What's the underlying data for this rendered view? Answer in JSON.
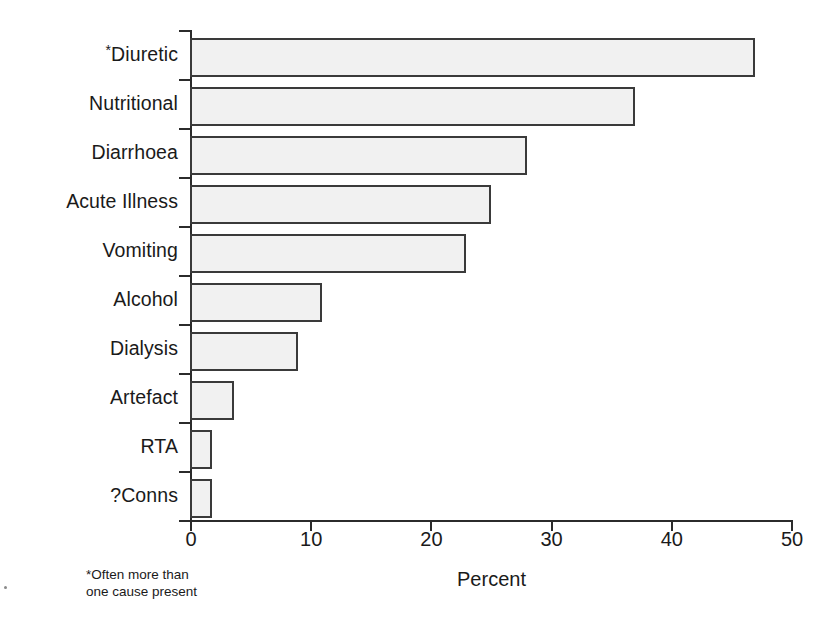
{
  "chart_data": {
    "type": "bar",
    "orientation": "horizontal",
    "title": "",
    "xlabel": "Percent",
    "ylabel": "",
    "xlim": [
      0,
      50
    ],
    "xticks": [
      0,
      10,
      20,
      30,
      40,
      50
    ],
    "xtick_labels": [
      "0",
      "10",
      "20",
      "30",
      "40",
      "50"
    ],
    "grid": false,
    "legend": null,
    "categories": [
      "*Diuretic",
      "Nutritional",
      "Diarrhoea",
      "Acute Illness",
      "Vomiting",
      "Alcohol",
      "Dialysis",
      "Artefact",
      "RTA",
      "?Conns"
    ],
    "values": [
      47,
      37,
      28,
      25,
      23,
      11,
      9,
      3.7,
      1.8,
      1.8
    ],
    "annotations": [
      "*Often more than one cause present"
    ],
    "bar_fill_color": "#f1f1f1",
    "bar_edge_color": "#3a3a3a",
    "axis_color": "#2b2b2b"
  },
  "labels": {
    "cat_0": "Diuretic",
    "cat_0_marker": "*",
    "cat_1": "Nutritional",
    "cat_2": "Diarrhoea",
    "cat_3": "Acute Illness",
    "cat_4": "Vomiting",
    "cat_5": "Alcohol",
    "cat_6": "Dialysis",
    "cat_7": "Artefact",
    "cat_8": "RTA",
    "cat_9": "?Conns"
  },
  "axis": {
    "x_title": "Percent",
    "tick_0": "0",
    "tick_1": "10",
    "tick_2": "20",
    "tick_3": "30",
    "tick_4": "40",
    "tick_5": "50"
  },
  "footnote": {
    "text": "*Often more than\none cause present"
  }
}
